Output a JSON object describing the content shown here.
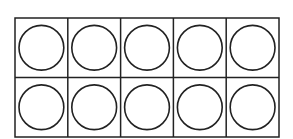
{
  "diagram": {
    "type": "ten-frame",
    "rows": 2,
    "columns": 5,
    "cells": [
      {
        "row": 1,
        "col": 1,
        "content": "empty-circle"
      },
      {
        "row": 1,
        "col": 2,
        "content": "empty-circle"
      },
      {
        "row": 1,
        "col": 3,
        "content": "empty-circle"
      },
      {
        "row": 1,
        "col": 4,
        "content": "empty-circle"
      },
      {
        "row": 1,
        "col": 5,
        "content": "empty-circle"
      },
      {
        "row": 2,
        "col": 1,
        "content": "empty-circle"
      },
      {
        "row": 2,
        "col": 2,
        "content": "empty-circle"
      },
      {
        "row": 2,
        "col": 3,
        "content": "empty-circle"
      },
      {
        "row": 2,
        "col": 4,
        "content": "empty-circle"
      },
      {
        "row": 2,
        "col": 5,
        "content": "empty-circle"
      }
    ],
    "colors": {
      "line": "#222222",
      "circle": "#222222",
      "background": "#ffffff"
    }
  }
}
